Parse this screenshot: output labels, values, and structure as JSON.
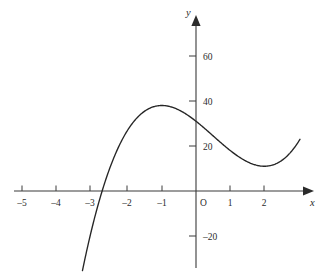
{
  "figure": {
    "background_color": "#ffffff",
    "axis_color": "#3a3a3a",
    "curve_color": "#262626",
    "text_color": "#2b2b2b",
    "origin_label": "O",
    "x_axis_name": "x",
    "y_axis_name": "y"
  },
  "chart_data": {
    "type": "line",
    "title": "",
    "subtitle": "",
    "xlabel": "x",
    "ylabel": "y",
    "grid": false,
    "legend": null,
    "axis_style": "arrowed-cartesian-axes",
    "xlim": [
      -5.2,
      3.3
    ],
    "ylim": [
      -30,
      72
    ],
    "x_ticks": [
      -5,
      -4,
      -3,
      -2,
      -1,
      1,
      2
    ],
    "x_tick_labels": [
      "–5",
      "–4",
      "–3",
      "–2",
      "–1",
      "1",
      "2"
    ],
    "y_ticks": [
      -20,
      20,
      40,
      60
    ],
    "y_tick_labels": [
      "–20",
      "20",
      "40",
      "60"
    ],
    "equation": "y = 2x^3 - 3x^2 - 12x + 31",
    "features": {
      "local_maximum": {
        "x": -2,
        "y": 53
      },
      "local_minimum": {
        "x": 1,
        "y": 24
      },
      "y_intercept": {
        "x": 0,
        "y": 31
      },
      "x_intercept": {
        "x": -4.1,
        "y": 0
      }
    },
    "x": [
      -4.45,
      -4.3,
      -4.1,
      -3.9,
      -3.7,
      -3.5,
      -3.3,
      -3.1,
      -2.9,
      -2.7,
      -2.5,
      -2.3,
      -2.1,
      -2.0,
      -1.9,
      -1.7,
      -1.5,
      -1.3,
      -1.1,
      -0.9,
      -0.7,
      -0.5,
      -0.3,
      -0.1,
      0.1,
      0.3,
      0.5,
      0.7,
      0.9,
      1.0,
      1.1,
      1.3,
      1.5,
      1.7,
      1.9,
      2.1,
      2.3,
      2.5,
      2.7,
      2.9,
      3.05
    ],
    "y": [
      -31.9,
      -24.1,
      -14.2,
      -5.2,
      2.8,
      3.5,
      14.9,
      22.3,
      28.8,
      34.4,
      39.3,
      43.4,
      46.8,
      53.0,
      52.7,
      51.3,
      49.0,
      46.1,
      42.7,
      38.8,
      34.7,
      30.5,
      26.2,
      22.1,
      29.8,
      27.2,
      25.5,
      24.4,
      24.1,
      24.0,
      24.3,
      25.8,
      28.6,
      33.0,
      39.2,
      47.4,
      57.9,
      70.9,
      86.7,
      105.5,
      61.5
    ]
  },
  "a11y": {
    "description": "Graph of a cubic curve on labelled x and y axes"
  }
}
